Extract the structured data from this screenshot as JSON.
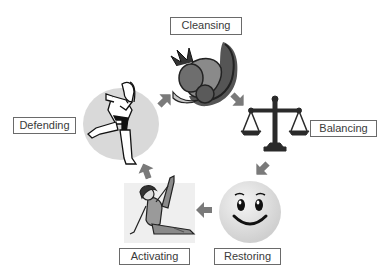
{
  "diagram": {
    "type": "cycle",
    "stages": [
      {
        "id": "cleansing",
        "label": "Cleansing",
        "icon": "cornucopia-icon"
      },
      {
        "id": "balancing",
        "label": "Balancing",
        "icon": "balance-scale-icon"
      },
      {
        "id": "restoring",
        "label": "Restoring",
        "icon": "smiley-face-icon"
      },
      {
        "id": "activating",
        "label": "Activating",
        "icon": "stretching-person-icon"
      },
      {
        "id": "defending",
        "label": "Defending",
        "icon": "karate-kick-icon"
      }
    ],
    "flow": [
      {
        "from": "defending",
        "to": "cleansing"
      },
      {
        "from": "cleansing",
        "to": "balancing"
      },
      {
        "from": "balancing",
        "to": "restoring"
      },
      {
        "from": "restoring",
        "to": "activating"
      },
      {
        "from": "activating",
        "to": "defending"
      }
    ],
    "colors": {
      "arrow": "#7a7a7a",
      "label_border": "#6a6a6a",
      "label_text": "#3a3a3a",
      "defending_circle": "#d9d9d9",
      "smiley_fill": "#e6e6e6",
      "activating_bg": "#efefef"
    }
  }
}
